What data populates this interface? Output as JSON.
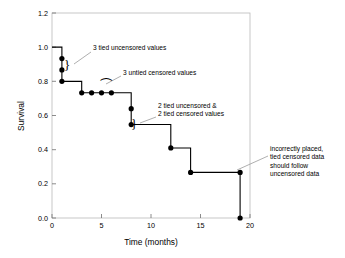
{
  "chart_data": {
    "type": "line",
    "title": "",
    "xlabel": "Time (months)",
    "ylabel": "Survival",
    "xlim": [
      0,
      20
    ],
    "ylim": [
      0.0,
      1.2
    ],
    "grid": false,
    "legend": "none",
    "xticks": [
      "0",
      "5",
      "10",
      "15",
      "20"
    ],
    "xtick_values": [
      0,
      5,
      10,
      15,
      20
    ],
    "yticks": [
      "0.0",
      "0.2",
      "0.4",
      "0.6",
      "0.8",
      "1.0",
      "1.2"
    ],
    "ytick_values": [
      0.0,
      0.2,
      0.4,
      0.6,
      0.8,
      1.0,
      1.2
    ],
    "series": [
      {
        "name": "Kaplan-Meier survival estimate",
        "step_path": [
          [
            0,
            1.0
          ],
          [
            1,
            1.0
          ],
          [
            1,
            0.8
          ],
          [
            3,
            0.8
          ],
          [
            3,
            0.733
          ],
          [
            8,
            0.733
          ],
          [
            8,
            0.547
          ],
          [
            12,
            0.547
          ],
          [
            12,
            0.41
          ],
          [
            14,
            0.41
          ],
          [
            14,
            0.267
          ],
          [
            19,
            0.267
          ],
          [
            19,
            0.0
          ]
        ],
        "points": [
          {
            "x": 1,
            "y": 0.933,
            "label": "tied uncensored"
          },
          {
            "x": 1,
            "y": 0.867,
            "label": "tied uncensored"
          },
          {
            "x": 1,
            "y": 0.8,
            "label": "tied uncensored"
          },
          {
            "x": 3,
            "y": 0.733,
            "label": "censored"
          },
          {
            "x": 4,
            "y": 0.733,
            "label": "censored"
          },
          {
            "x": 5,
            "y": 0.733,
            "label": "censored"
          },
          {
            "x": 6,
            "y": 0.733,
            "label": "censored"
          },
          {
            "x": 8,
            "y": 0.64,
            "label": "tied uncensored"
          },
          {
            "x": 8,
            "y": 0.547,
            "label": "tied uncensored"
          },
          {
            "x": 12,
            "y": 0.41,
            "label": "uncensored"
          },
          {
            "x": 14,
            "y": 0.267,
            "label": "uncensored"
          },
          {
            "x": 19,
            "y": 0.267,
            "label": "tied censored misplaced"
          },
          {
            "x": 19,
            "y": 0.0,
            "label": "uncensored"
          }
        ]
      }
    ],
    "annotations": [
      {
        "id": "annot-3-tied-uncensored",
        "lines": [
          "3 tied uncensored values"
        ],
        "text_x": 93,
        "text_y": 50,
        "leader_from": [
          91,
          52
        ],
        "leader_to": [
          74,
          64
        ],
        "brace": {
          "x": 64,
          "y": 69,
          "glyph": "}"
        }
      },
      {
        "id": "annot-3-untied-censored",
        "lines": [
          "3 untied censored values"
        ],
        "text_x": 123,
        "text_y": 75,
        "leader_from": [
          121,
          76
        ],
        "leader_to": [
          106,
          84
        ],
        "brace": {
          "x": 101,
          "y": 90,
          "glyph": "⁀"
        }
      },
      {
        "id": "annot-2-tied-mixed",
        "lines": [
          "2 tied uncensored &",
          "2 tied censored values"
        ],
        "text_x": 158,
        "text_y": 108,
        "leader_from": [
          156,
          117
        ],
        "leader_to": [
          140,
          123
        ],
        "brace": {
          "x": 131,
          "y": 128,
          "glyph": "}"
        }
      },
      {
        "id": "annot-incorrectly-placed",
        "lines": [
          "incorrectly placed,",
          "tied censored data",
          "should follow",
          "uncensored data"
        ],
        "text_x": 270,
        "text_y": 151,
        "leader_from": [
          268,
          156
        ],
        "leader_to": [
          237,
          170
        ],
        "brace": null
      }
    ]
  },
  "figure": {
    "axis_frame": "visible",
    "background": "#ffffff",
    "line_color": "#000000",
    "frame_color": "#b9b9b9",
    "leader_color": "#9a9a9a"
  }
}
